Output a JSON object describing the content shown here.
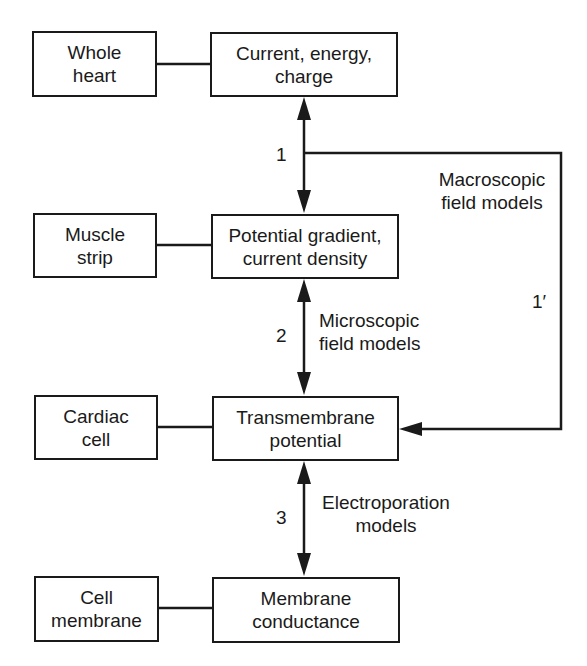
{
  "diagram": {
    "left_column": [
      {
        "id": "whole-heart",
        "label": "Whole\nheart"
      },
      {
        "id": "muscle-strip",
        "label": "Muscle\nstrip"
      },
      {
        "id": "cardiac-cell",
        "label": "Cardiac\ncell"
      },
      {
        "id": "cell-membrane",
        "label": "Cell\nmembrane"
      }
    ],
    "right_column": [
      {
        "id": "current-energy-charge",
        "label": "Current, energy,\ncharge"
      },
      {
        "id": "potential-gradient",
        "label": "Potential gradient,\ncurrent density"
      },
      {
        "id": "transmembrane-potential",
        "label": "Transmembrane\npotential"
      },
      {
        "id": "membrane-conductance",
        "label": "Membrane\nconductance"
      }
    ],
    "links": [
      {
        "number": "1",
        "from": "current-energy-charge",
        "to": "potential-gradient",
        "label": "",
        "bidirectional": true
      },
      {
        "number": "2",
        "from": "potential-gradient",
        "to": "transmembrane-potential",
        "label": "Microscopic\nfield models",
        "bidirectional": true
      },
      {
        "number": "3",
        "from": "transmembrane-potential",
        "to": "membrane-conductance",
        "label": "Electroporation\nmodels",
        "bidirectional": true
      },
      {
        "number": "1′",
        "from": "link-1",
        "to": "transmembrane-potential",
        "label": "Macroscopic\nfield models",
        "bidirectional": false
      }
    ],
    "colors": {
      "line": "#1a1a1a",
      "background": "#ffffff"
    }
  }
}
